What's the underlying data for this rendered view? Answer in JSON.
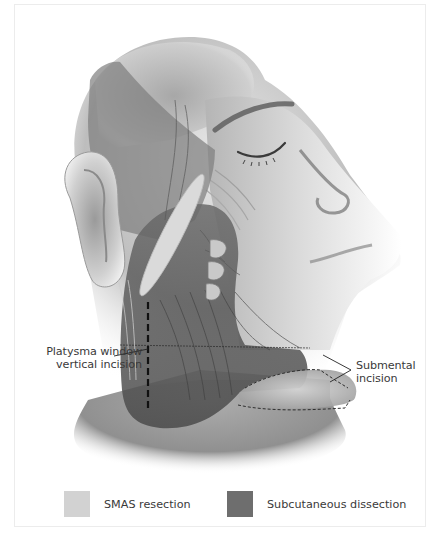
{
  "figure": {
    "labels": {
      "left": {
        "line1": "Platysma window",
        "line2": "vertical incision"
      },
      "right": {
        "line1": "Submental",
        "line2": "incision"
      }
    },
    "legend": [
      {
        "label": "SMAS resection",
        "color": "#d2d2d2"
      },
      {
        "label": "Subcutaneous dissection",
        "color": "#6e6e6e"
      }
    ],
    "colors": {
      "background": "#ffffff",
      "frame_border": "#ececec",
      "smas_region": "#d4d4d4",
      "subcutaneous_region": "#5f5f5f",
      "text": "#3a3a3a"
    }
  }
}
